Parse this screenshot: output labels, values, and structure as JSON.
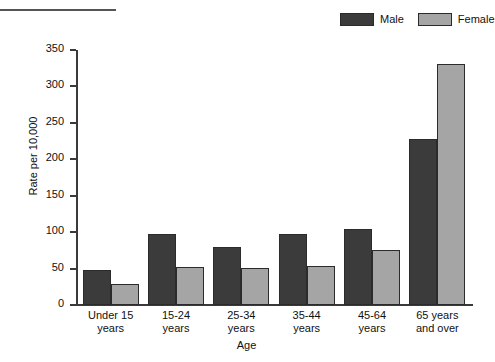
{
  "chart_data": {
    "type": "bar",
    "title": "",
    "xlabel": "Age",
    "ylabel": "Rate per 10,000",
    "categories": [
      "Under 15 years",
      "15-24 years",
      "25-34 years",
      "35-44 years",
      "45-64 years",
      "65 years and over"
    ],
    "category_lines": [
      [
        "Under 15",
        "years"
      ],
      [
        "15-24",
        "years"
      ],
      [
        "25-34",
        "years"
      ],
      [
        "35-44",
        "years"
      ],
      [
        "45-64",
        "years"
      ],
      [
        "65 years",
        "and over"
      ]
    ],
    "series": [
      {
        "name": "Male",
        "color": "#3b3b3b",
        "values": [
          48,
          98,
          80,
          98,
          104,
          228
        ]
      },
      {
        "name": "Female",
        "color": "#a5a5a5",
        "values": [
          29,
          52,
          51,
          54,
          76,
          331
        ]
      }
    ],
    "ylim": [
      0,
      350
    ],
    "yticks": [
      0,
      50,
      100,
      150,
      200,
      250,
      300,
      350
    ],
    "ytick_labels": [
      "0",
      "50",
      "100",
      "150",
      "200",
      "250",
      "300",
      "350"
    ],
    "grid": false,
    "legend_position": "top-right"
  },
  "legend": {
    "entries": [
      {
        "label": "Male",
        "color": "#3b3b3b"
      },
      {
        "label": "Female",
        "color": "#a5a5a5"
      }
    ]
  },
  "axes": {
    "y_title": "Rate per 10,000",
    "x_title": "Age"
  }
}
